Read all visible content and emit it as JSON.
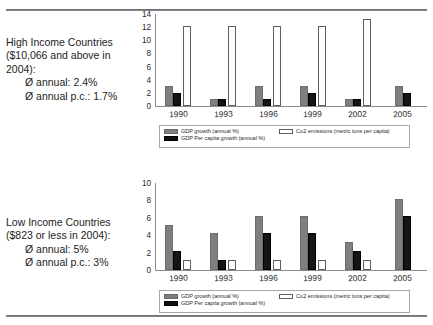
{
  "captions": {
    "high": {
      "lines": [
        "High Income Countries",
        "($10,066 and above in",
        "2004):"
      ],
      "stats": [
        "Ø annual: 2.4%",
        "Ø annual p.c.: 1.7%"
      ]
    },
    "low": {
      "lines": [
        "Low Income Countries",
        "($823 or less in 2004):"
      ],
      "stats": [
        "Ø annual: 5%",
        "Ø annual p.c.: 3%"
      ]
    }
  },
  "legend": {
    "gdp_growth": "GDP growth (annual %)",
    "gdp_per_capita": "GDP Per capita growth (annual %)",
    "co2": "Co2 emissions (metric tons per capita)"
  },
  "chart_data": [
    {
      "id": "high-income",
      "type": "bar",
      "title": "High Income Countries",
      "categories": [
        "1990",
        "1993",
        "1996",
        "1999",
        "2002",
        "2005"
      ],
      "series": [
        {
          "name": "GDP growth (annual %)",
          "values": [
            3,
            1,
            3,
            3,
            1,
            3
          ],
          "color": "#7f7f7f"
        },
        {
          "name": "GDP Per capita growth (annual %)",
          "values": [
            2,
            1,
            1,
            2,
            1,
            2
          ],
          "color": "#151515"
        },
        {
          "name": "Co2 emissions (metric tons per capita)",
          "values": [
            12.2,
            12.2,
            12.2,
            12.2,
            13.3,
            0
          ],
          "color": "#ffffff"
        }
      ],
      "yticks": [
        0,
        2,
        4,
        6,
        8,
        10,
        12,
        14
      ],
      "ylim": [
        0,
        14
      ],
      "xlabel": "",
      "ylabel": "",
      "grid": false,
      "legend_position": "bottom"
    },
    {
      "id": "low-income",
      "type": "bar",
      "title": "Low Income Countries",
      "categories": [
        "1990",
        "1993",
        "1996",
        "1999",
        "2002",
        "2005"
      ],
      "series": [
        {
          "name": "GDP growth (annual %)",
          "values": [
            5.2,
            4.2,
            6.2,
            6.2,
            3.2,
            8.2
          ],
          "color": "#7f7f7f"
        },
        {
          "name": "GDP Per capita growth (annual %)",
          "values": [
            2.2,
            1.2,
            4.2,
            4.2,
            2.2,
            6.2
          ],
          "color": "#151515"
        },
        {
          "name": "Co2 emissions (metric tons per capita)",
          "values": [
            1.2,
            1.2,
            1.2,
            1.2,
            1.2,
            0
          ],
          "color": "#ffffff"
        }
      ],
      "yticks": [
        0,
        2,
        4,
        6,
        8,
        10
      ],
      "ylim": [
        0,
        10
      ],
      "xlabel": "",
      "ylabel": "",
      "grid": false,
      "legend_position": "bottom"
    }
  ]
}
